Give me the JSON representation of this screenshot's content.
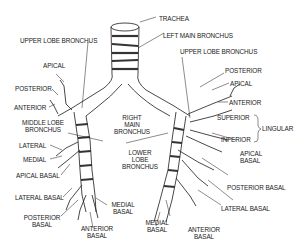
{
  "diagram": {
    "stroke_color": "#1a1a1a",
    "background": "#ffffff",
    "labels": {
      "trachea": "TRACHEA",
      "left_main_bronchus": "LEFT MAIN BRONCHUS",
      "upper_lobe_bronchus_right": "UPPER LOBE BRONCHUS",
      "upper_lobe_bronchus_left": "UPPER LOBE BRONCHUS",
      "right_main_bronchus_1": "RIGHT",
      "right_main_bronchus_2": "MAIN",
      "right_main_bronchus_3": "BRONCHUS",
      "lower_lobe_bronchus_1": "LOWER",
      "lower_lobe_bronchus_2": "LOBE",
      "lower_lobe_bronchus_3": "BRONCHUS",
      "right": {
        "apical": "APICAL",
        "posterior": "POSTERIOR",
        "anterior": "ANTERIOR",
        "middle_lobe_1": "MIDDLE LOBE",
        "middle_lobe_2": "BRONCHUS",
        "lateral": "LATERAL",
        "medial": "MEDIAL",
        "apical_basal": "APICAL BASAL",
        "lateral_basal": "LATERAL BASAL",
        "posterior_basal_1": "POSTERIOR",
        "posterior_basal_2": "BASAL",
        "anterior_basal_1": "ANTERIOR",
        "anterior_basal_2": "BASAL",
        "medial_basal_1": "MEDIAL",
        "medial_basal_2": "BASAL"
      },
      "left": {
        "posterior": "POSTERIOR",
        "apical": "APICAL",
        "anterior": "ANTERIOR",
        "superior": "SUPERIOR",
        "inferior": "INFERIOR",
        "lingular": "LINGULAR",
        "apical_basal_1": "APICAL",
        "apical_basal_2": "BASAL",
        "posterior_basal": "POSTERIOR BASAL",
        "lateral_basal": "LATERAL BASAL",
        "medial_basal_1": "MEDIAL",
        "medial_basal_2": "BASAL",
        "anterior_basal_1": "ANTERIOR",
        "anterior_basal_2": "BASAL"
      }
    }
  }
}
